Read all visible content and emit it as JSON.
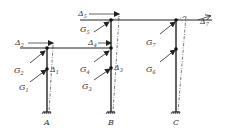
{
  "diagram": {
    "type": "structural frame with lateral displacements",
    "columns": [
      {
        "id": "A",
        "label": "A"
      },
      {
        "id": "B",
        "label": "B"
      },
      {
        "id": "C",
        "label": "C"
      }
    ],
    "displacements": [
      {
        "symbol": "Δ",
        "index": "1"
      },
      {
        "symbol": "Δ",
        "index": "2"
      },
      {
        "symbol": "Δ",
        "index": "3"
      },
      {
        "symbol": "Δ",
        "index": "4"
      },
      {
        "symbol": "Δ",
        "index": "5"
      },
      {
        "symbol": "Δ",
        "index": "7"
      }
    ],
    "loads": [
      {
        "symbol": "G",
        "index": "1"
      },
      {
        "symbol": "G",
        "index": "2"
      },
      {
        "symbol": "G",
        "index": "3"
      },
      {
        "symbol": "G",
        "index": "4"
      },
      {
        "symbol": "G",
        "index": "5"
      },
      {
        "symbol": "G",
        "index": "6"
      },
      {
        "symbol": "G",
        "index": "7"
      }
    ],
    "colors": {
      "line": "#222222",
      "background": "#ffffff"
    }
  }
}
